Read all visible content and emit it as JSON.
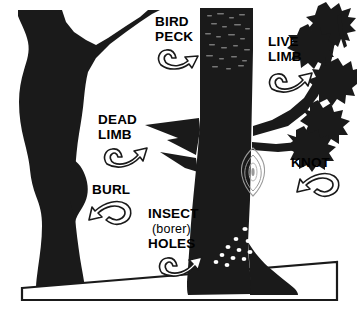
{
  "figure": {
    "type": "illustration",
    "background_color": "#ffffff",
    "ink_color": "#1a1a1a",
    "width": 357,
    "height": 318
  },
  "labels": [
    {
      "id": "bird-peck",
      "lines": [
        "BIRD",
        "PECK"
      ],
      "line1": "BIRD",
      "line2": "PECK",
      "arrow_direction": "right",
      "points_to": "speckled bark area on upper right trunk"
    },
    {
      "id": "live-limb",
      "lines": [
        "LIVE",
        "LIMB"
      ],
      "line1": "LIVE",
      "line2": "LIMB",
      "arrow_direction": "up-right",
      "points_to": "leafy branch at upper right"
    },
    {
      "id": "dead-limb",
      "lines": [
        "DEAD",
        "LIMB"
      ],
      "line1": "DEAD",
      "line2": "LIMB",
      "arrow_direction": "up-right",
      "points_to": "bare pointed branch stub on right trunk"
    },
    {
      "id": "knot",
      "lines": [
        "KNOT"
      ],
      "line1": "KNOT",
      "arrow_direction": "left",
      "points_to": "almond shaped knot on right trunk"
    },
    {
      "id": "burl",
      "lines": [
        "BURL"
      ],
      "line1": "BURL",
      "arrow_direction": "left",
      "points_to": "bulge on left trunk"
    },
    {
      "id": "insect-holes",
      "lines": [
        "INSECT",
        "(borer)",
        "HOLES"
      ],
      "line1": "INSECT",
      "line2": "(borer)",
      "line3": "HOLES",
      "arrow_direction": "up-right",
      "points_to": "cluster of small white holes near trunk base"
    }
  ],
  "elements": {
    "left_tree": "forked trunk with burl bulge",
    "right_tree": "main trunk with limbs, knot and insect holes",
    "ground": "sloping ground band outline",
    "foliage": "jagged leaf clusters on live limb"
  }
}
